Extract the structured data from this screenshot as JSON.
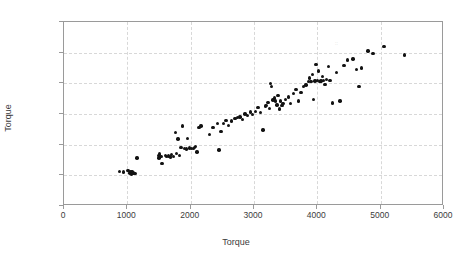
{
  "chart_data": {
    "type": "scatter",
    "title": "",
    "xlabel": "Torque",
    "ylabel": "Torque",
    "xlim": [
      0,
      6000
    ],
    "ylim": [
      0,
      6000
    ],
    "xticks": [
      0,
      1000,
      2000,
      3000,
      4000,
      5000,
      6000
    ],
    "yticks": [
      0,
      1000,
      2000,
      3000,
      4000,
      5000,
      6000
    ],
    "xtick_labels": [
      "0",
      "1000",
      "2000",
      "3000",
      "4000",
      "5000",
      "6000"
    ],
    "ytick_labels": [
      "0",
      "1000",
      "2000",
      "3000",
      "4000",
      "5000",
      "6000"
    ],
    "grid": true,
    "grid_style": "dashed",
    "legend": "none",
    "marker": "filled-circle",
    "marker_color": "#121212",
    "series": [
      {
        "name": "Torque",
        "points": [
          [
            880,
            1120
          ],
          [
            940,
            1105
          ],
          [
            1010,
            1160
          ],
          [
            1040,
            1075
          ],
          [
            1055,
            1120
          ],
          [
            1070,
            1050
          ],
          [
            1085,
            1105
          ],
          [
            1100,
            1080
          ],
          [
            1120,
            1065
          ],
          [
            1150,
            1560
          ],
          [
            1490,
            1640
          ],
          [
            1500,
            1560
          ],
          [
            1510,
            1700
          ],
          [
            1530,
            1610
          ],
          [
            1545,
            1390
          ],
          [
            1600,
            1640
          ],
          [
            1620,
            1610
          ],
          [
            1650,
            1625
          ],
          [
            1680,
            1600
          ],
          [
            1700,
            1680
          ],
          [
            1730,
            1610
          ],
          [
            1760,
            2390
          ],
          [
            1780,
            1720
          ],
          [
            1800,
            2180
          ],
          [
            1820,
            1650
          ],
          [
            1850,
            1900
          ],
          [
            1870,
            2610
          ],
          [
            1900,
            1880
          ],
          [
            1930,
            1860
          ],
          [
            1950,
            2200
          ],
          [
            1980,
            1890
          ],
          [
            2010,
            1880
          ],
          [
            2040,
            1870
          ],
          [
            2060,
            1900
          ],
          [
            2080,
            1940
          ],
          [
            2100,
            1760
          ],
          [
            2130,
            2560
          ],
          [
            2160,
            2610
          ],
          [
            2300,
            2330
          ],
          [
            2350,
            2560
          ],
          [
            2420,
            2700
          ],
          [
            2450,
            1820
          ],
          [
            2480,
            2430
          ],
          [
            2520,
            2690
          ],
          [
            2560,
            2790
          ],
          [
            2600,
            2620
          ],
          [
            2640,
            2770
          ],
          [
            2700,
            2850
          ],
          [
            2740,
            2880
          ],
          [
            2780,
            2900
          ],
          [
            2820,
            2830
          ],
          [
            2860,
            3000
          ],
          [
            2900,
            2950
          ],
          [
            2940,
            3060
          ],
          [
            2980,
            2980
          ],
          [
            3020,
            3090
          ],
          [
            3060,
            3220
          ],
          [
            3100,
            3040
          ],
          [
            3140,
            2480
          ],
          [
            3180,
            3260
          ],
          [
            3200,
            3280
          ],
          [
            3220,
            3380
          ],
          [
            3240,
            3180
          ],
          [
            3260,
            3990
          ],
          [
            3280,
            3900
          ],
          [
            3300,
            3460
          ],
          [
            3320,
            3520
          ],
          [
            3340,
            3430
          ],
          [
            3360,
            3290
          ],
          [
            3380,
            3600
          ],
          [
            3400,
            3160
          ],
          [
            3420,
            3430
          ],
          [
            3440,
            3270
          ],
          [
            3460,
            3350
          ],
          [
            3500,
            3480
          ],
          [
            3540,
            3560
          ],
          [
            3580,
            3350
          ],
          [
            3620,
            3660
          ],
          [
            3660,
            3790
          ],
          [
            3700,
            3430
          ],
          [
            3740,
            3700
          ],
          [
            3780,
            3900
          ],
          [
            3820,
            3950
          ],
          [
            3860,
            4060
          ],
          [
            3880,
            4180
          ],
          [
            3900,
            4060
          ],
          [
            3920,
            4280
          ],
          [
            3940,
            3480
          ],
          [
            3960,
            4080
          ],
          [
            3980,
            4620
          ],
          [
            4000,
            4100
          ],
          [
            4020,
            4400
          ],
          [
            4040,
            4060
          ],
          [
            4060,
            4080
          ],
          [
            4080,
            4220
          ],
          [
            4100,
            4090
          ],
          [
            4120,
            3960
          ],
          [
            4140,
            4120
          ],
          [
            4180,
            4550
          ],
          [
            4200,
            4090
          ],
          [
            4240,
            3360
          ],
          [
            4300,
            4350
          ],
          [
            4360,
            3430
          ],
          [
            4420,
            4580
          ],
          [
            4480,
            4760
          ],
          [
            4560,
            4800
          ],
          [
            4620,
            4460
          ],
          [
            4660,
            3900
          ],
          [
            4700,
            4500
          ],
          [
            4800,
            5050
          ],
          [
            4880,
            4980
          ],
          [
            5050,
            5200
          ],
          [
            5380,
            4920
          ]
        ]
      }
    ]
  },
  "axis": {
    "x_tick_labels": [
      "0",
      "1000",
      "2000",
      "3000",
      "4000",
      "5000",
      "6000"
    ],
    "y_tick_labels": [
      "0",
      "1000",
      "2000",
      "3000",
      "4000",
      "5000",
      "6000"
    ],
    "x_title": "Torque",
    "y_title": "Torque"
  }
}
